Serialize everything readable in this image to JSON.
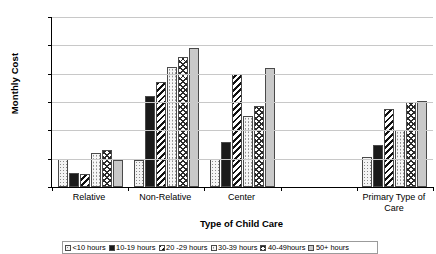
{
  "chart_data": {
    "type": "bar",
    "title": "",
    "xlabel": "Type of Child Care",
    "ylabel": "Monthly Cost",
    "ylim": [
      0,
      600
    ],
    "ytick_labels": [
      "$600",
      "$500",
      "$400",
      "$300",
      "$200",
      "$100",
      "$0"
    ],
    "ytick_values": [
      600,
      500,
      400,
      300,
      200,
      100,
      0
    ],
    "grid": true,
    "legend_position": "bottom",
    "categories": [
      "Relative",
      "Non-Relative",
      "Center",
      "",
      "Primary Type of Care"
    ],
    "series": [
      {
        "name": "<10 hours",
        "pattern": "light-dots",
        "values": [
          100,
          95,
          100,
          null,
          105
        ]
      },
      {
        "name": "10-19 hours",
        "pattern": "solid-black",
        "values": [
          50,
          320,
          160,
          null,
          150
        ]
      },
      {
        "name": "20 -29 hours",
        "pattern": "dark-diagonal",
        "values": [
          45,
          370,
          400,
          null,
          275
        ]
      },
      {
        "name": "30-39 hours",
        "pattern": "light-dots-2",
        "values": [
          120,
          425,
          250,
          null,
          200
        ]
      },
      {
        "name": "40-49hours",
        "pattern": "crosshatch",
        "values": [
          130,
          460,
          285,
          null,
          300
        ]
      },
      {
        "name": "50+ hours",
        "pattern": "solid-gray",
        "values": [
          95,
          490,
          420,
          null,
          305
        ]
      }
    ]
  },
  "axis": {
    "y_title": "Monthly Cost",
    "x_title": "Type of Child Care"
  }
}
